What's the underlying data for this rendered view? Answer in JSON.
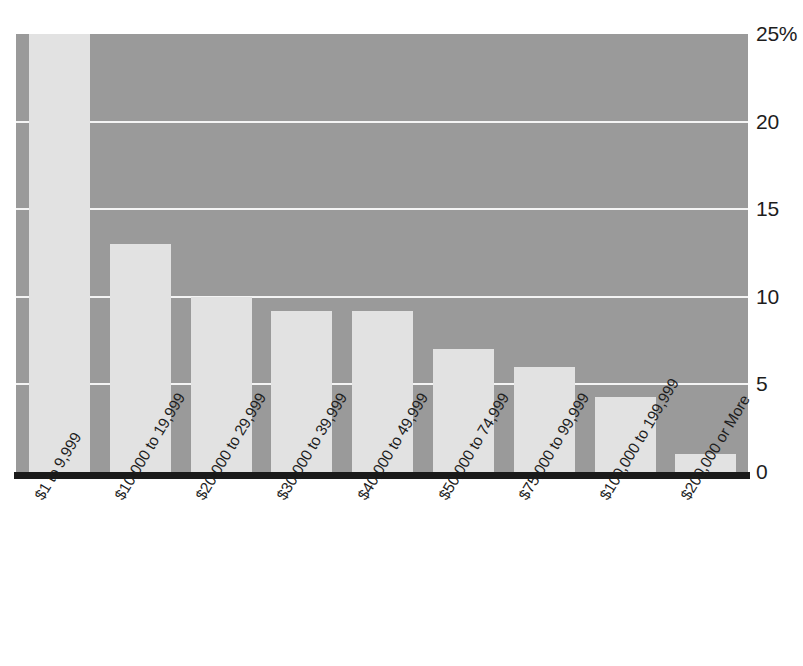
{
  "chart_data": {
    "type": "bar",
    "title": "",
    "xlabel": "",
    "ylabel": "",
    "ylim": [
      0,
      25
    ],
    "grid": true,
    "legend": "none",
    "orientation": "vertical",
    "y_axis_position": "right",
    "x_tick_rotation_degrees": -59,
    "categories": [
      "$1 to 9,999",
      "$10,000 to 19,999",
      "$20,000 to 29,999",
      "$30,000 to 39,999",
      "$40,000 to 49,999",
      "$50,000 to 74,999",
      "$75,000 to 99,999",
      "$100,000 to 199,999",
      "$200,000 or More"
    ],
    "values": [
      25,
      13,
      10,
      9.2,
      9.2,
      7,
      6,
      4.3,
      1
    ],
    "value_notes": "First bar is clipped at the top of the plot area at 25%",
    "y_ticks": [
      0,
      5,
      10,
      15,
      20,
      25
    ],
    "y_tick_labels": [
      "0",
      "5",
      "10",
      "15",
      "20",
      "25%"
    ],
    "colors": {
      "plot_background": "#9a9a9a",
      "bar_fill": "#e2e2e2",
      "gridline": "#f4f4f4",
      "baseline": "#1a1a1a",
      "text": "#1d1d1d",
      "page_background": "#ffffff"
    }
  }
}
